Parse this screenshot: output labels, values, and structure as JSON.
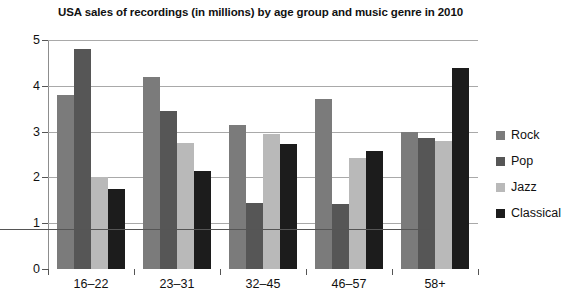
{
  "chart_data": {
    "type": "bar",
    "title": "USA sales of recordings (in millions) by age group and music genre in 2010",
    "xlabel": "",
    "ylabel": "",
    "ylim": [
      0,
      5
    ],
    "ytick_labels": [
      "5",
      "4",
      "3",
      "2",
      "1",
      "0"
    ],
    "ytick_values": [
      5,
      4,
      3,
      2,
      1,
      0
    ],
    "grid": true,
    "legend_position": "right",
    "categories": [
      "16–22",
      "23–31",
      "32–45",
      "46–57",
      "58+"
    ],
    "series": [
      {
        "name": "Rock",
        "color": "#7b7b7b",
        "values": [
          3.8,
          4.2,
          3.15,
          3.72,
          3.0
        ]
      },
      {
        "name": "Pop",
        "color": "#565656",
        "values": [
          4.8,
          3.45,
          1.45,
          1.42,
          2.85
        ]
      },
      {
        "name": "Jazz",
        "color": "#b9b9b9",
        "values": [
          2.0,
          2.75,
          2.95,
          2.42,
          2.8
        ]
      },
      {
        "name": "Classical",
        "color": "#1c1c1c",
        "values": [
          1.75,
          2.15,
          2.72,
          2.58,
          4.38
        ]
      }
    ]
  },
  "legend": {
    "items": [
      {
        "label": "Rock",
        "color": "#7b7b7b"
      },
      {
        "label": "Pop",
        "color": "#565656"
      },
      {
        "label": "Jazz",
        "color": "#b9b9b9"
      },
      {
        "label": "Classical",
        "color": "#1c1c1c"
      }
    ]
  }
}
